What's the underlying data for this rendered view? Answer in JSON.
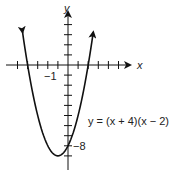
{
  "chart_data": {
    "type": "line",
    "title": "",
    "equation_label": "y = (x + 4)(x − 2)",
    "xlabel": "x",
    "ylabel": "y",
    "x_tick_label": "−1",
    "y_tick_label": "−8",
    "xlim": [
      -5,
      5
    ],
    "ylim": [
      -9.5,
      4
    ],
    "x_ticks": [
      -5,
      -4,
      -3,
      -2,
      -1,
      1,
      2,
      3,
      4,
      5
    ],
    "y_ticks": [
      -9,
      -8,
      -7,
      -6,
      -5,
      -4,
      -3,
      -2,
      -1,
      1,
      2,
      3,
      4
    ],
    "series": [
      {
        "name": "y = (x + 4)(x - 2)",
        "x": [
          -4.5,
          -4,
          -3,
          -2,
          -1,
          0,
          1,
          2,
          2.5
        ],
        "y": [
          3.25,
          0,
          -5,
          -8,
          -9,
          -8,
          -5,
          0,
          3.25
        ]
      }
    ],
    "vertex": [
      -1,
      -9
    ],
    "y_intercept": -8,
    "x_intercepts": [
      -4,
      2
    ],
    "grid": false
  },
  "colors": {
    "ink": "#111111",
    "text": "#222222"
  }
}
